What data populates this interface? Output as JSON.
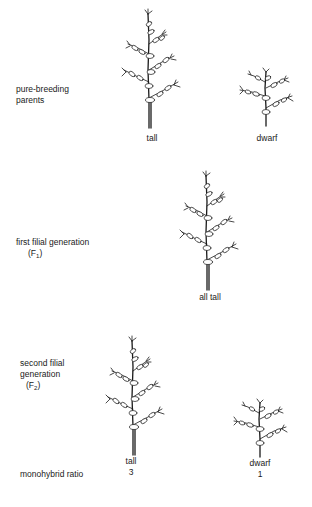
{
  "diagram": {
    "type": "monohybrid cross illustration (pea plant height)",
    "rows": [
      {
        "id": "parents",
        "label_lines": [
          "pure-breeding",
          "parents"
        ],
        "plants": [
          {
            "caption": "tall",
            "size": "tall"
          },
          {
            "caption": "dwarf",
            "size": "dwarf"
          }
        ]
      },
      {
        "id": "f1",
        "label_lines": [
          "first filial generation"
        ],
        "label_symbol": "(F",
        "label_sub": "1",
        "label_close": ")",
        "plants": [
          {
            "caption": "all tall",
            "size": "tall"
          }
        ]
      },
      {
        "id": "f2",
        "label_lines": [
          "second filial",
          "generation"
        ],
        "label_symbol": "(F",
        "label_sub": "2",
        "label_close": ")",
        "plants": [
          {
            "caption": "tall",
            "size": "tall",
            "ratio": "3"
          },
          {
            "caption": "dwarf",
            "size": "dwarf",
            "ratio": "1"
          }
        ]
      }
    ],
    "ratio_label": "monohybrid ratio"
  },
  "colors": {
    "ink": "#1a1a1a",
    "background": "#ffffff"
  }
}
